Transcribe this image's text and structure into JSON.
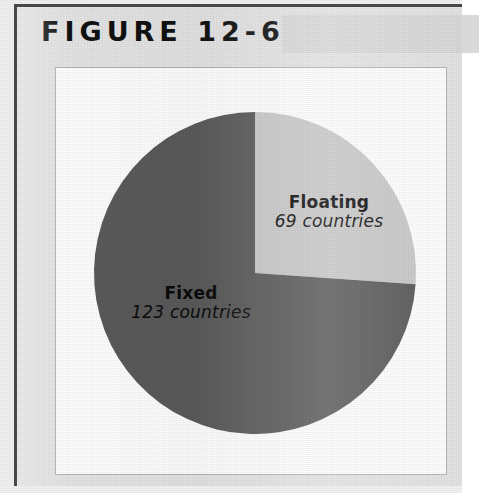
{
  "figure": {
    "title": "FIGURE 12-6",
    "colors": {
      "plate_background": "#e3e3e3",
      "header_band": "#d9d9d9",
      "panel_background": "#fdfdfd",
      "panel_border": "#b4b4b4",
      "frame_rule": "#4a4a4a",
      "label_text": "#0b0b0b"
    }
  },
  "chart_data": {
    "type": "pie",
    "title": "FIGURE 12-6",
    "subtitle": "",
    "xlabel": "",
    "ylabel": "",
    "unit": "countries",
    "total": 192,
    "categories": [
      "Floating",
      "Fixed"
    ],
    "values": [
      69,
      123
    ],
    "value_labels": [
      "69 countries",
      "123 countries"
    ],
    "colors": [
      "#c8c8c8",
      "#5a5a5a"
    ],
    "legend": "none",
    "labels_inside": true,
    "start_angle_deg": 0,
    "direction": "clockwise",
    "slices": [
      {
        "name": "Floating",
        "value": 69,
        "value_label": "69 countries",
        "color": "#c8c8c8",
        "start_angle_deg": 0,
        "end_angle_deg": 94,
        "label_position": "inside-right"
      },
      {
        "name": "Fixed",
        "value": 123,
        "value_label": "123 countries",
        "color": "#5a5a5a",
        "start_angle_deg": 94,
        "end_angle_deg": 360,
        "label_position": "inside-left"
      }
    ],
    "geometry": {
      "center_x": 199,
      "center_y": 205,
      "radius": 161
    }
  }
}
